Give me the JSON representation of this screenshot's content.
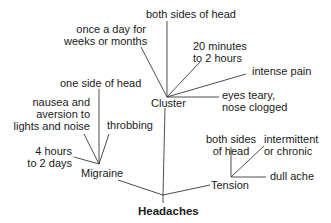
{
  "diagram": {
    "root": {
      "label": "Headaches"
    },
    "branches": [
      {
        "label": "Migraine",
        "attributes": [
          {
            "label": "one side of head"
          },
          {
            "line1": "nausea and",
            "line2": "aversion to",
            "line3": "lights and noise"
          },
          {
            "label": "throbbing"
          },
          {
            "line1": "4 hours",
            "line2": "to 2 days"
          }
        ]
      },
      {
        "label": "Cluster",
        "attributes": [
          {
            "label": "both sides of head"
          },
          {
            "line1": "once a day for",
            "line2": "weeks or months"
          },
          {
            "line1": "20 minutes",
            "line2": "to 2 hours"
          },
          {
            "label": "intense pain"
          },
          {
            "line1": "eyes teary,",
            "line2": "nose clogged"
          }
        ]
      },
      {
        "label": "Tension",
        "attributes": [
          {
            "line1": "both sides",
            "line2": "of head"
          },
          {
            "line1": "intermittent",
            "line2": "or chronic"
          },
          {
            "label": "dull ache"
          }
        ]
      }
    ]
  }
}
